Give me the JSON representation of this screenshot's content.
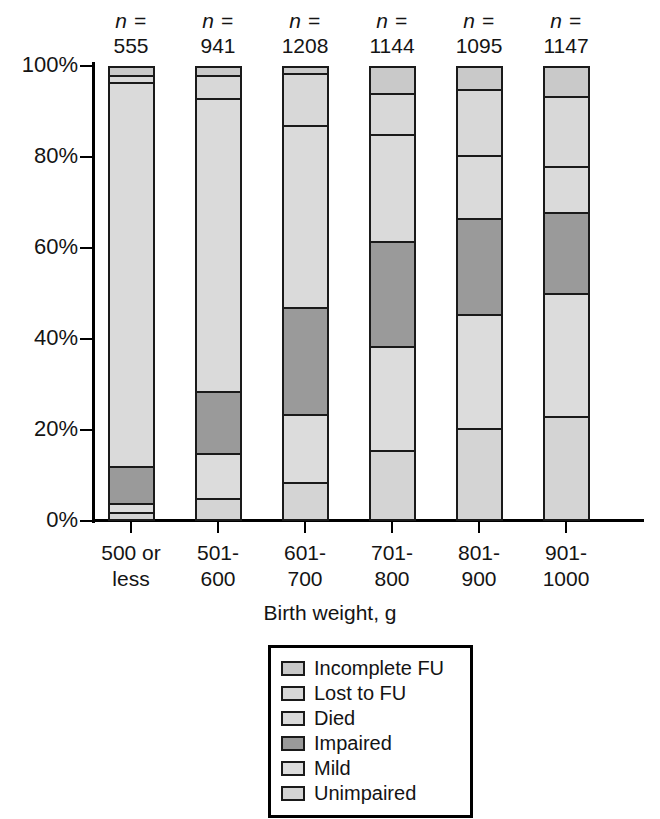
{
  "chart_data": {
    "type": "bar",
    "subtype": "stacked-bar-100-percent",
    "title": "",
    "xlabel": "Birth weight, g",
    "ylabel": "",
    "ylim": [
      0,
      100
    ],
    "ytick_labels": [
      "0%",
      "20%",
      "40%",
      "60%",
      "80%",
      "100%"
    ],
    "ytick_values": [
      0,
      20,
      40,
      60,
      80,
      100
    ],
    "grid": false,
    "legend_position": "bottom-center",
    "categories": [
      "500 or less",
      "501-600",
      "601-700",
      "701-800",
      "801-900",
      "901-1000"
    ],
    "category_lines": [
      [
        "500 or",
        "less"
      ],
      [
        "501-",
        "600"
      ],
      [
        "601-",
        "700"
      ],
      [
        "701-",
        "800"
      ],
      [
        "801-",
        "900"
      ],
      [
        "901-",
        "1000"
      ]
    ],
    "n_prefix": "n =",
    "n_values": [
      555,
      941,
      1208,
      1144,
      1095,
      1147
    ],
    "stack_order_bottom_to_top": [
      "Unimpaired",
      "Mild",
      "Impaired",
      "Died",
      "Lost to FU",
      "Incomplete FU"
    ],
    "series": [
      {
        "name": "Unimpaired",
        "color": "#d4d4d4",
        "values": [
          2.0,
          5.0,
          8.5,
          15.5,
          20.5,
          23.0
        ]
      },
      {
        "name": "Mild",
        "color": "#dcdcdc",
        "values": [
          2.0,
          10.0,
          15.0,
          23.0,
          25.0,
          27.0
        ]
      },
      {
        "name": "Impaired",
        "color": "#9a9a9a",
        "values": [
          8.0,
          13.5,
          23.5,
          23.0,
          21.0,
          18.0
        ]
      },
      {
        "name": "Died",
        "color": "#dadada",
        "values": [
          84.5,
          64.5,
          40.0,
          23.5,
          14.0,
          10.0
        ]
      },
      {
        "name": "Lost to FU",
        "color": "#d8d8d8",
        "values": [
          1.5,
          5.0,
          11.5,
          9.0,
          14.5,
          15.5
        ]
      },
      {
        "name": "Incomplete FU",
        "color": "#c9c9c9",
        "values": [
          2.0,
          2.0,
          1.5,
          6.0,
          5.0,
          6.5
        ]
      }
    ],
    "cumulative_tops_percent": [
      [
        2.0,
        4.0,
        12.0,
        96.5,
        98.0,
        100.0
      ],
      [
        5.0,
        15.0,
        28.5,
        93.0,
        98.0,
        100.0
      ],
      [
        8.5,
        23.5,
        47.0,
        87.0,
        98.5,
        100.0
      ],
      [
        15.5,
        38.5,
        61.5,
        85.0,
        94.0,
        100.0
      ],
      [
        20.5,
        45.5,
        66.5,
        80.5,
        95.0,
        100.0
      ],
      [
        23.0,
        50.0,
        68.0,
        78.0,
        93.5,
        100.0
      ]
    ]
  },
  "legend": {
    "items": [
      {
        "label": "Incomplete FU",
        "color": "#c9c9c9"
      },
      {
        "label": "Lost to FU",
        "color": "#d8d8d8"
      },
      {
        "label": "Died",
        "color": "#dadada"
      },
      {
        "label": "Impaired",
        "color": "#9a9a9a"
      },
      {
        "label": "Mild",
        "color": "#dcdcdc"
      },
      {
        "label": "Unimpaired",
        "color": "#d4d4d4"
      }
    ]
  },
  "axis": {
    "x_title": "Birth weight, g"
  },
  "colors": {
    "axis": "#000000",
    "outline": "#1a1a1a",
    "text": "#141414",
    "background": "#ffffff"
  }
}
